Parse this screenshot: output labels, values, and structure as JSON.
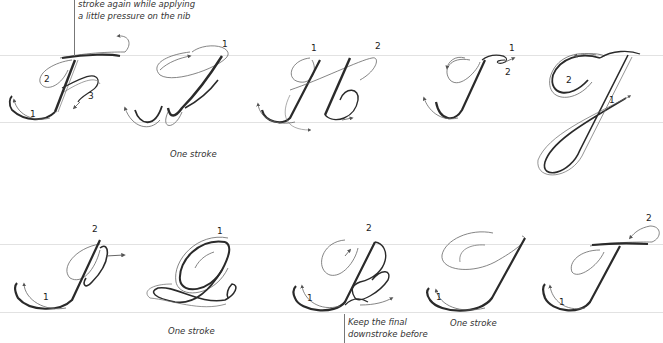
{
  "callouts": {
    "top": {
      "line1": "stroke again while applying",
      "line2": "a little pressure on the nib"
    },
    "bottom": {
      "line1": "Keep the final",
      "line2": "downstroke before"
    }
  },
  "captions": {
    "g": "One stroke",
    "q": "One stroke",
    "s": "One stroke"
  },
  "letters": [
    {
      "letter": "F",
      "row": 1,
      "stroke_numbers": [
        "1",
        "2",
        "3"
      ]
    },
    {
      "letter": "G",
      "row": 1,
      "stroke_numbers": [
        "1"
      ]
    },
    {
      "letter": "H",
      "row": 1,
      "stroke_numbers": [
        "1",
        "2"
      ]
    },
    {
      "letter": "I",
      "row": 1,
      "stroke_numbers": [
        "1",
        "2"
      ]
    },
    {
      "letter": "J",
      "row": 1,
      "stroke_numbers": [
        "1",
        "2"
      ]
    },
    {
      "letter": "P",
      "row": 2,
      "stroke_numbers": [
        "1",
        "2"
      ]
    },
    {
      "letter": "Q",
      "row": 2,
      "stroke_numbers": [
        "1"
      ]
    },
    {
      "letter": "R",
      "row": 2,
      "stroke_numbers": [
        "1",
        "2"
      ]
    },
    {
      "letter": "S",
      "row": 2,
      "stroke_numbers": [
        "1"
      ]
    },
    {
      "letter": "T",
      "row": 2,
      "stroke_numbers": [
        "1",
        "2"
      ]
    }
  ],
  "labels": {
    "f1": "1",
    "f2": "2",
    "f3": "3",
    "g1": "1",
    "h1": "1",
    "h2": "2",
    "i1": "1",
    "i2": "2",
    "j1": "1",
    "j2": "2",
    "p1": "1",
    "p2": "2",
    "q1": "1",
    "r1": "1",
    "r2": "2",
    "s1": "1",
    "t1": "1",
    "t2": "2"
  },
  "colors": {
    "ink": "#2a2a2a",
    "guide_outline": "#6a6a6a",
    "guideline": "#e2e2e2"
  }
}
